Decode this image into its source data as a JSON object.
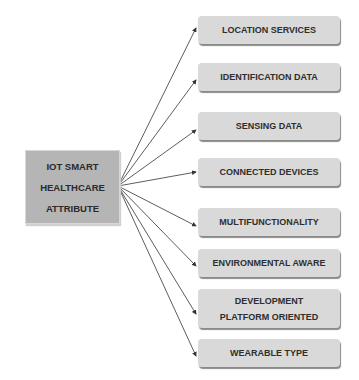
{
  "diagram": {
    "root": {
      "lines": [
        "IOT SMART",
        "HEALTHCARE",
        "ATTRIBUTE"
      ],
      "color": "#b5b5b5"
    },
    "children": [
      {
        "lines": [
          "LOCATION SERVICES"
        ]
      },
      {
        "lines": [
          "IDENTIFICATION DATA"
        ]
      },
      {
        "lines": [
          "SENSING DATA"
        ]
      },
      {
        "lines": [
          "CONNECTED DEVICES"
        ]
      },
      {
        "lines": [
          "MULTIFUNCTIONALITY"
        ]
      },
      {
        "lines": [
          "ENVIRONMENTAL AWARE"
        ]
      },
      {
        "lines": [
          "DEVELOPMENT",
          "PLATFORM ORIENTED"
        ]
      },
      {
        "lines": [
          "WEARABLE TYPE"
        ]
      }
    ],
    "child_color": "#d9d9d9",
    "arrow_color": "#333333"
  }
}
